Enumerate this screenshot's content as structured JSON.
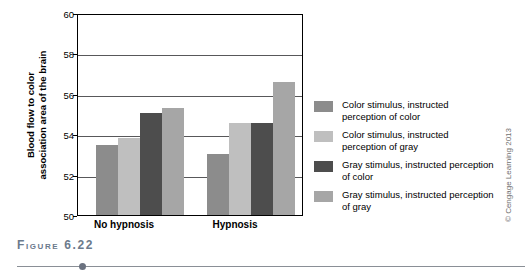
{
  "figure": {
    "caption": "Figure 6.22",
    "credit": "© Cengage Learning 2013"
  },
  "chart_data": {
    "type": "bar",
    "title": "",
    "xlabel": "",
    "ylabel": "Blood flow to color\nassociation area of the brain",
    "ylabel_line1": "Blood flow to color",
    "ylabel_line2": "association area of the brain",
    "categories": [
      "No hypnosis",
      "Hypnosis"
    ],
    "ylim": [
      50,
      60
    ],
    "yticks": [
      50,
      52,
      54,
      56,
      58,
      60
    ],
    "ytick_labels": [
      "50",
      "52",
      "54",
      "56",
      "58",
      "60"
    ],
    "grid": true,
    "legend_position": "right",
    "series": [
      {
        "name": "Color stimulus, instructed perception of color",
        "label_line1": "Color stimulus, instructed",
        "label_line2": "perception of color",
        "color": "#8c8c8c",
        "values": [
          53.5,
          53.05
        ]
      },
      {
        "name": "Color stimulus, instructed perception of gray",
        "label_line1": "Color stimulus, instructed",
        "label_line2": "perception of gray",
        "color": "#bfbfbf",
        "values": [
          53.85,
          54.6
        ]
      },
      {
        "name": "Gray stimulus, instructed perception of color",
        "label_line1": "Gray stimulus, instructed",
        "label_line2": "perception of color",
        "color": "#4d4d4d",
        "values": [
          55.1,
          54.6
        ]
      },
      {
        "name": "Gray stimulus, instructed perception of gray",
        "label_line1": "Gray stimulus, instructed",
        "label_line2": "perception of gray",
        "color": "#a6a6a6",
        "values": [
          55.35,
          56.65
        ]
      }
    ]
  }
}
